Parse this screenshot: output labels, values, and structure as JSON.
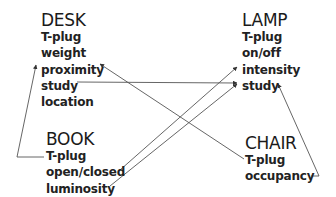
{
  "diagram": {
    "nodes": [
      {
        "id": "desk",
        "title": "DESK",
        "items": [
          "T-plug",
          "weight",
          "proximity",
          "study",
          "location"
        ]
      },
      {
        "id": "lamp",
        "title": "LAMP",
        "items": [
          "T-plug",
          "on/off",
          "intensity",
          "study"
        ]
      },
      {
        "id": "book",
        "title": "BOOK",
        "items": [
          "T-plug",
          "open/closed",
          "luminosity"
        ]
      },
      {
        "id": "chair",
        "title": "CHAIR",
        "items": [
          "T-plug",
          "occupancy"
        ]
      }
    ],
    "edges": [
      {
        "from": "book.T-plug",
        "to": "desk.proximity"
      },
      {
        "from": "desk.study",
        "to": "lamp.study"
      },
      {
        "from": "chair.T-plug",
        "to": "desk.proximity"
      },
      {
        "from": "book.open/closed",
        "to": "lamp.intensity"
      },
      {
        "from": "book.luminosity",
        "to": "lamp.study"
      },
      {
        "from": "chair.occupancy",
        "to": "lamp.study"
      }
    ],
    "colors": {
      "line": "#555555",
      "text": "#222222"
    }
  }
}
